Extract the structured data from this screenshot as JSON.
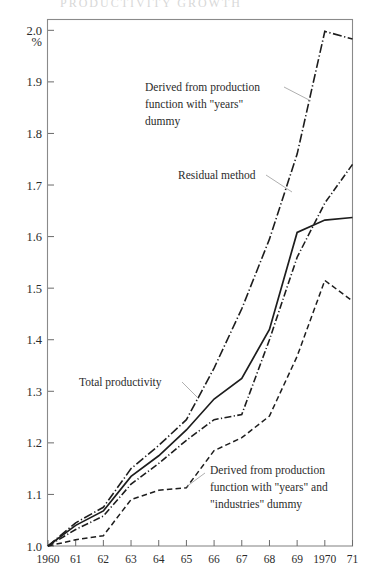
{
  "figure": {
    "cut_title_fragment": "PRODUCTIVITY  GROWTH",
    "axis_unit_label": "%"
  },
  "annotations": [
    {
      "id": "anno-prod-years",
      "lines": [
        "Derived from production",
        "function with \"years\"",
        "dummy"
      ]
    },
    {
      "id": "anno-residual",
      "lines": [
        "Residual method"
      ]
    },
    {
      "id": "anno-total",
      "lines": [
        "Total productivity"
      ]
    },
    {
      "id": "anno-prod-years-ind",
      "lines": [
        "Derived from production",
        "function with \"years\" and",
        "\"industries\" dummy"
      ]
    }
  ],
  "chart_data": {
    "type": "line",
    "title": "",
    "subtitle": "",
    "xlabel": "",
    "ylabel": "%",
    "grid": false,
    "legend": "annotations-inline",
    "xlim": [
      1960,
      1971
    ],
    "ylim": [
      1.0,
      2.02
    ],
    "x": [
      1960,
      1961,
      1962,
      1963,
      1964,
      1965,
      1966,
      1967,
      1968,
      1969,
      1970,
      1971
    ],
    "xtick_labels": [
      "1960",
      "61",
      "62",
      "63",
      "64",
      "65",
      "66",
      "67",
      "68",
      "69",
      "1970",
      "71"
    ],
    "ytick_labels": [
      "1.0",
      "1.1",
      "1.2",
      "1.3",
      "1.4",
      "1.5",
      "1.6",
      "1.7",
      "1.8",
      "1.9",
      "2.0"
    ],
    "ytick_values": [
      1.0,
      1.1,
      1.2,
      1.3,
      1.4,
      1.5,
      1.6,
      1.7,
      1.8,
      1.9,
      2.0
    ],
    "series": [
      {
        "name": "Derived from production function with \"years\" dummy",
        "style": "dash-dot",
        "values": [
          1.0,
          1.045,
          1.075,
          1.15,
          1.195,
          1.245,
          1.345,
          1.46,
          1.595,
          1.76,
          1.998,
          1.983
        ]
      },
      {
        "name": "Total productivity",
        "style": "solid",
        "values": [
          1.0,
          1.04,
          1.068,
          1.135,
          1.175,
          1.225,
          1.285,
          1.325,
          1.42,
          1.608,
          1.632,
          1.637
        ]
      },
      {
        "name": "Residual method",
        "style": "dash-dot-short",
        "values": [
          1.0,
          1.032,
          1.058,
          1.12,
          1.16,
          1.205,
          1.245,
          1.255,
          1.4,
          1.56,
          1.665,
          1.74
        ]
      },
      {
        "name": "Derived from production function with \"years\" and \"industries\" dummy",
        "style": "dashed",
        "values": [
          1.0,
          1.012,
          1.02,
          1.09,
          1.108,
          1.113,
          1.185,
          1.21,
          1.252,
          1.368,
          1.515,
          1.475
        ]
      }
    ]
  }
}
